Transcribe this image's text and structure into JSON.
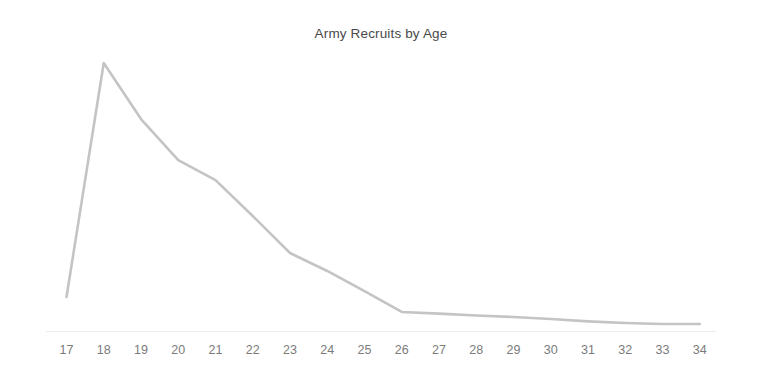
{
  "chart_data": {
    "type": "line",
    "title": "Army Recruits by Age",
    "xlabel": "",
    "ylabel": "",
    "categories": [
      17,
      18,
      19,
      20,
      21,
      22,
      23,
      24,
      25,
      26,
      27,
      28,
      29,
      30,
      31,
      32,
      33,
      34
    ],
    "tick_labels": [
      "17",
      "18",
      "19",
      "20",
      "21",
      "22",
      "23",
      "24",
      "25",
      "26",
      "27",
      "28",
      "29",
      "30",
      "31",
      "32",
      "33",
      "34"
    ],
    "values": [
      12.7,
      100.0,
      79.1,
      63.8,
      56.3,
      42.9,
      29.1,
      22.4,
      14.9,
      7.1,
      6.5,
      5.8,
      5.2,
      4.5,
      3.6,
      3.0,
      2.6,
      2.6
    ],
    "series": [
      {
        "name": "Recruits",
        "color": "#c4c4c4",
        "values": [
          12.7,
          100.0,
          79.1,
          63.8,
          56.3,
          42.9,
          29.1,
          22.4,
          14.9,
          7.1,
          6.5,
          5.8,
          5.2,
          4.5,
          3.6,
          3.0,
          2.6,
          2.6
        ]
      }
    ],
    "xlim": [
      17,
      34
    ],
    "ylim": [
      0,
      100
    ],
    "grid": false,
    "legend": false,
    "legend_position": "none",
    "axis_color": "#ededed",
    "tick_label_color": "#7b7b7b",
    "title_color": "#494949",
    "background_color": "#ffffff"
  }
}
